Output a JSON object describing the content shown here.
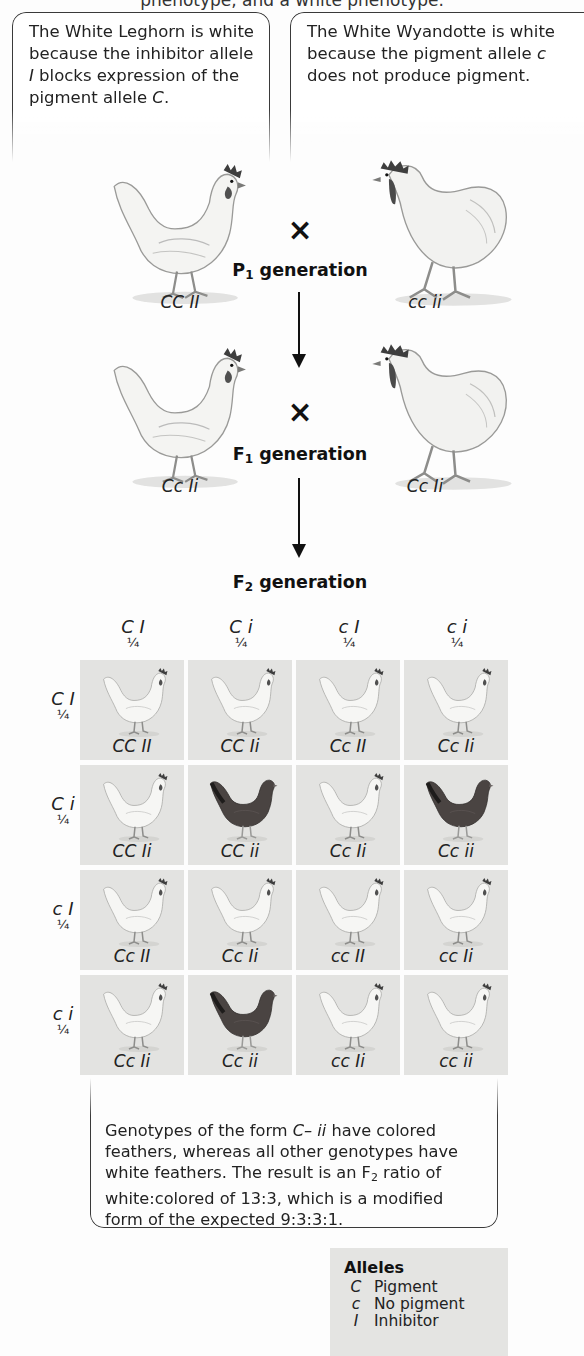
{
  "top_partial_text": "phenotype, and a white phenotype.",
  "callouts_top": {
    "left": {
      "parts": [
        "The White Leghorn is white because the inhibitor allele ",
        "I",
        " blocks expression of the pigment allele ",
        "C",
        "."
      ]
    },
    "right": {
      "parts": [
        "The White Wyandotte is white because the pigment allele ",
        "c",
        " does not produce pigment."
      ]
    }
  },
  "cross_symbol": "×",
  "p1": {
    "label_prefix": "P",
    "label_sub": "1",
    "label_suffix": " generation",
    "left_genotype": "CC II",
    "right_genotype": "cc ii",
    "left_breed": "White Leghorn hen",
    "right_breed": "White Wyandotte rooster"
  },
  "f1": {
    "label_prefix": "F",
    "label_sub": "1",
    "label_suffix": " generation",
    "left_genotype": "Cc Ii",
    "right_genotype": "Cc Ii"
  },
  "f2": {
    "label_prefix": "F",
    "label_sub": "2",
    "label_suffix": " generation",
    "columns": [
      {
        "gamete": "C I",
        "freq": "¼"
      },
      {
        "gamete": "C i",
        "freq": "¼"
      },
      {
        "gamete": "c I",
        "freq": "¼"
      },
      {
        "gamete": "c i",
        "freq": "¼"
      }
    ],
    "rows": [
      {
        "gamete": "C I",
        "freq": "¼"
      },
      {
        "gamete": "C i",
        "freq": "¼"
      },
      {
        "gamete": "c I",
        "freq": "¼"
      },
      {
        "gamete": "c i",
        "freq": "¼"
      }
    ],
    "cells": [
      [
        {
          "genotype": "CC II",
          "phenotype": "white"
        },
        {
          "genotype": "CC Ii",
          "phenotype": "white"
        },
        {
          "genotype": "Cc II",
          "phenotype": "white"
        },
        {
          "genotype": "Cc Ii",
          "phenotype": "white"
        }
      ],
      [
        {
          "genotype": "CC Ii",
          "phenotype": "white"
        },
        {
          "genotype": "CC ii",
          "phenotype": "colored"
        },
        {
          "genotype": "Cc Ii",
          "phenotype": "white"
        },
        {
          "genotype": "Cc ii",
          "phenotype": "colored"
        }
      ],
      [
        {
          "genotype": "Cc II",
          "phenotype": "white"
        },
        {
          "genotype": "Cc Ii",
          "phenotype": "white"
        },
        {
          "genotype": "cc II",
          "phenotype": "white"
        },
        {
          "genotype": "cc Ii",
          "phenotype": "white"
        }
      ],
      [
        {
          "genotype": "Cc Ii",
          "phenotype": "white"
        },
        {
          "genotype": "Cc ii",
          "phenotype": "colored"
        },
        {
          "genotype": "cc Ii",
          "phenotype": "white"
        },
        {
          "genotype": "cc ii",
          "phenotype": "white"
        }
      ]
    ]
  },
  "callout_bottom": {
    "parts": [
      "Genotypes of the form ",
      "C– ii",
      " have colored feathers, whereas all other genotypes have white feathers. The result is an F",
      "2",
      " ratio of white:colored of 13:3, which is a modified form of the expected 9:3:3:1."
    ]
  },
  "alleles": {
    "title": "Alleles",
    "items": [
      {
        "symbol": "C",
        "meaning": "Pigment"
      },
      {
        "symbol": "c",
        "meaning": "No pigment"
      },
      {
        "symbol": "I",
        "meaning": "Inhibitor"
      }
    ]
  },
  "colors": {
    "cell_bg": "#e3e3e1",
    "white_chicken": "#f2f2f0",
    "colored_chicken": "#4a4442",
    "comb": "#3a3a3a",
    "line": "#111111"
  }
}
